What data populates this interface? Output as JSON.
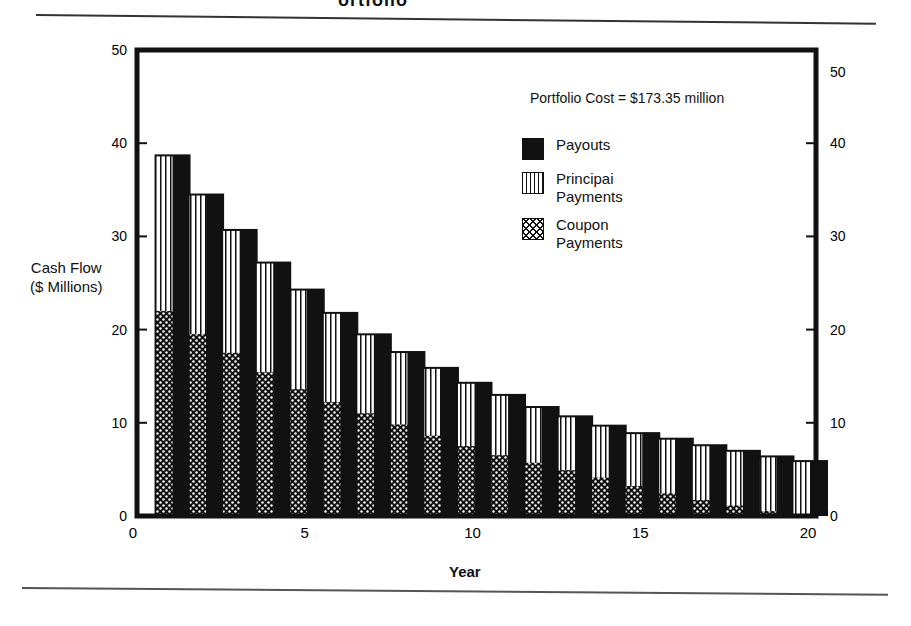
{
  "page": {
    "title_fragment": "ortfolio"
  },
  "chart_data": {
    "type": "bar",
    "stacked": true,
    "title": "",
    "annotation": "Portfolio Cost = $173.35 million",
    "xlabel": "Year",
    "ylabel": "Cash Flow ($ Millions)",
    "ylabel_lines": [
      "Cash Flow",
      "($ Millions)"
    ],
    "xlim": [
      0,
      21
    ],
    "ylim": [
      0,
      50
    ],
    "x_ticks": [
      0,
      5,
      10,
      15,
      20
    ],
    "y_ticks_left": [
      0,
      10,
      20,
      30,
      40,
      50
    ],
    "y_ticks_right": [
      0,
      10,
      20,
      30,
      40,
      50
    ],
    "grid": false,
    "legend_position": "upper right inside",
    "legend": [
      {
        "name": "Payouts",
        "pattern": "solid-black"
      },
      {
        "name": "Principai Payments",
        "lines": [
          "Principai",
          "Payments"
        ],
        "pattern": "vertical-stripes"
      },
      {
        "name": "Coupon Payments",
        "lines": [
          "Coupon",
          "Payments"
        ],
        "pattern": "crosshatch"
      }
    ],
    "categories": [
      1,
      2,
      3,
      4,
      5,
      6,
      7,
      8,
      9,
      10,
      11,
      12,
      13,
      14,
      15,
      16,
      17,
      18,
      19,
      20
    ],
    "series": [
      {
        "name": "Payouts",
        "values": [
          38.8,
          34.6,
          30.8,
          27.3,
          24.4,
          21.9,
          19.6,
          17.7,
          16.0,
          14.4,
          13.1,
          11.8,
          10.8,
          9.8,
          9.0,
          8.4,
          7.7,
          7.1,
          6.5,
          6.0
        ]
      },
      {
        "name": "Principal Payments",
        "values": [
          16.8,
          15.1,
          13.3,
          11.9,
          10.8,
          9.7,
          8.6,
          7.9,
          7.4,
          6.9,
          6.6,
          6.1,
          5.9,
          5.7,
          5.8,
          6.0,
          6.0,
          6.0,
          6.0,
          5.8
        ]
      },
      {
        "name": "Coupon Payments",
        "values": [
          22.0,
          19.5,
          17.5,
          15.4,
          13.6,
          12.2,
          11.0,
          9.8,
          8.6,
          7.5,
          6.5,
          5.7,
          4.9,
          4.1,
          3.2,
          2.4,
          1.7,
          1.1,
          0.5,
          0.2
        ]
      }
    ]
  }
}
